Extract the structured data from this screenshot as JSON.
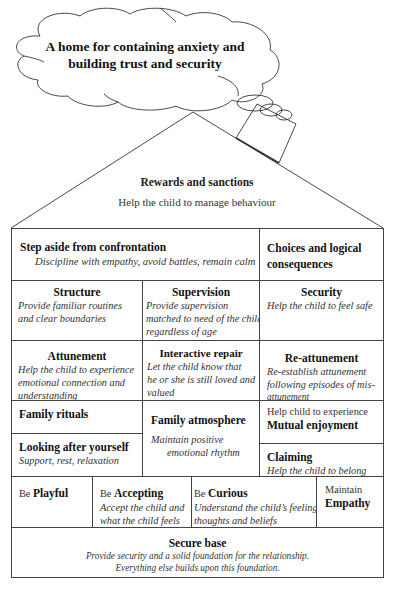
{
  "cloud": {
    "line1": "A home for containing anxiety and",
    "line2": "building trust and security"
  },
  "roof": {
    "title": "Rewards and sanctions",
    "subtitle": "Help the child to manage behaviour"
  },
  "rows": {
    "step_aside": {
      "title": "Step aside from confrontation",
      "desc": "Discipline with empathy, avoid battles, remain calm"
    },
    "choices": {
      "title_line1": "Choices and logical",
      "title_line2": "consequences"
    },
    "structure": {
      "title": "Structure",
      "desc_line1": "Provide familiar routines",
      "desc_line2": "and clear boundaries"
    },
    "supervision": {
      "title": "Supervision",
      "desc_line1": "Provide supervision",
      "desc_line2": "matched to need of the child",
      "desc_line3": "regardless of age"
    },
    "security": {
      "title": "Security",
      "desc": "Help the child to feel safe"
    },
    "attunement": {
      "title": "Attunement",
      "desc_line1": "Help the child to experience",
      "desc_line2": "emotional connection and",
      "desc_line3": "understanding"
    },
    "interactive_repair": {
      "title": "Interactive repair",
      "desc_line1": "Let the child know that",
      "desc_line2": "he or she is still loved and",
      "desc_line3": "valued"
    },
    "reattunement": {
      "title": "Re-attunement",
      "desc_line1": "Re-establish attunement",
      "desc_line2": "following episodes of mis-",
      "desc_line3": "attunement"
    },
    "family_rituals": {
      "title": "Family rituals"
    },
    "family_atmosphere": {
      "title": "Family atmosphere",
      "desc_line1": "Maintain positive",
      "desc_line2": "emotional rhythm"
    },
    "mutual_enjoyment": {
      "prefix": "Help child to experience",
      "title": "Mutual enjoyment"
    },
    "looking_after": {
      "title": "Looking after yourself",
      "desc": "Support, rest, relaxation"
    },
    "claiming": {
      "title": "Claiming",
      "desc": "Help the child to belong"
    },
    "playful": {
      "prefix": "Be ",
      "title": "Playful"
    },
    "accepting": {
      "prefix": "Be ",
      "title": "Accepting",
      "desc_line1": "Accept the child and",
      "desc_line2": "what the child feels"
    },
    "curious": {
      "prefix": "Be ",
      "title": "Curious",
      "desc_line1": "Understand the child’s feeling,",
      "desc_line2": "thoughts and beliefs"
    },
    "empathy": {
      "prefix": "Maintain",
      "title": "Empathy"
    },
    "secure_base": {
      "title": "Secure base",
      "desc_line1": "Provide security and a solid foundation for the relationship.",
      "desc_line2": "Everything else builds upon this foundation."
    }
  }
}
